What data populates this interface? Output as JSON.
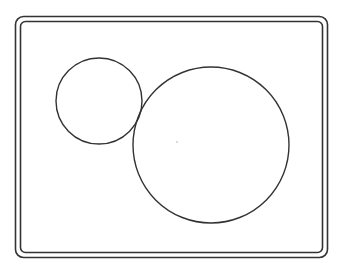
{
  "diagram": {
    "stroke_color": "#333333",
    "background": "#ffffff",
    "frame": {
      "outer": {
        "x": 15.5,
        "y": 16.5,
        "width": 312,
        "height": 241,
        "rx": 8
      },
      "inner": {
        "x": 20.5,
        "y": 21.5,
        "width": 302,
        "height": 231,
        "rx": 5
      }
    },
    "shapes": [
      {
        "type": "circle",
        "name": "small-circle",
        "cx": 99,
        "cy": 101,
        "r": 43
      },
      {
        "type": "circle",
        "name": "large-circle",
        "cx": 211,
        "cy": 145,
        "r": 78
      }
    ],
    "center_dot": {
      "cx": 177,
      "cy": 142,
      "r": 1,
      "color": "#cccccc"
    }
  }
}
